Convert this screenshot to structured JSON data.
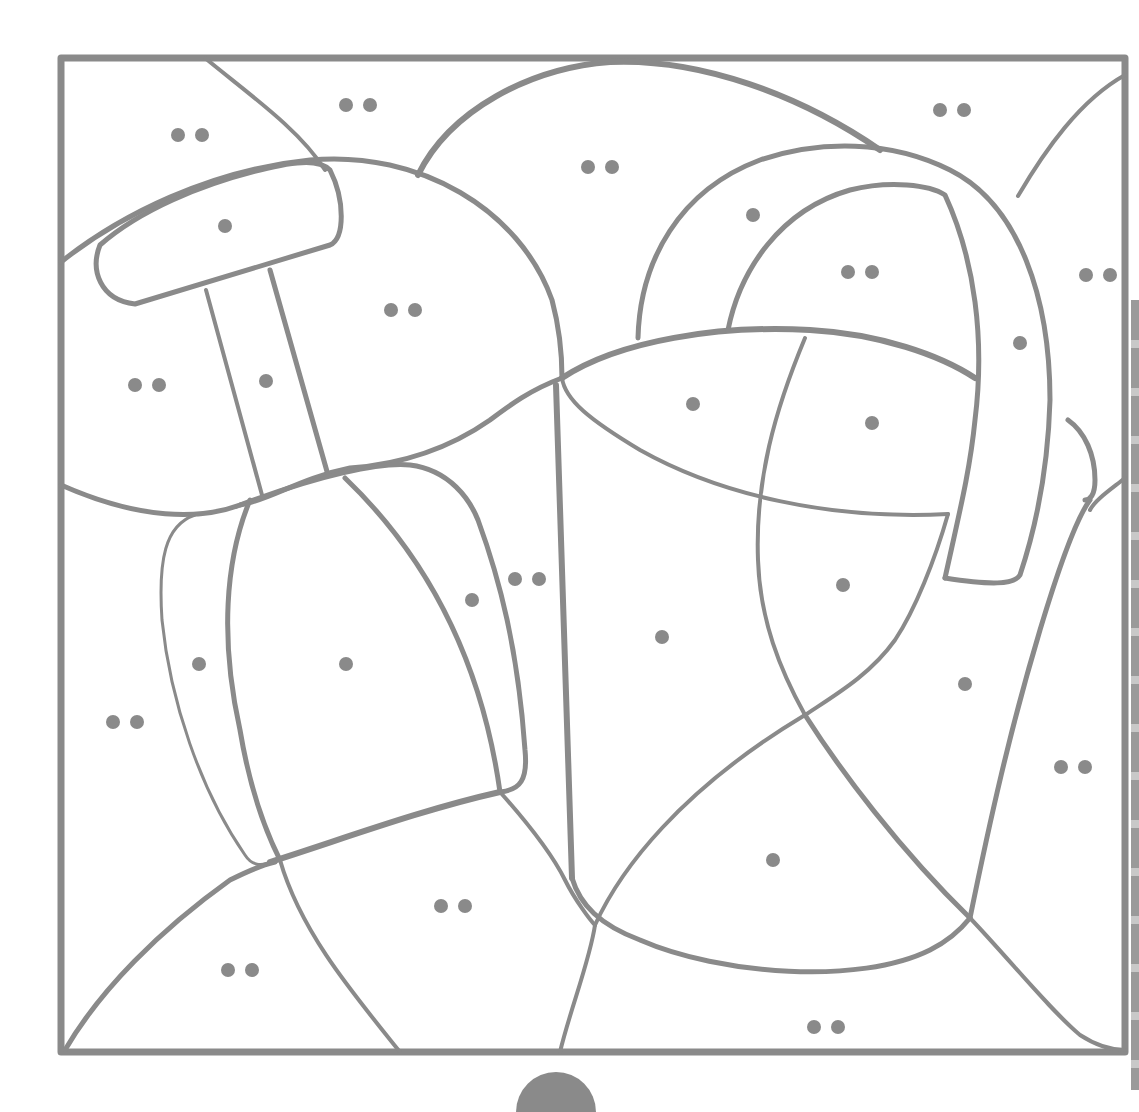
{
  "page": {
    "type": "color-by-code coloring page",
    "line_color": "#8a8a8a",
    "background": "#ffffff"
  },
  "frame": {
    "x": 58,
    "y": 55,
    "width": 1070,
    "height": 1000
  },
  "legend_codes": {
    "single_dot": "•",
    "double_dot": "••"
  },
  "markers": [
    {
      "x": 190,
      "y": 135,
      "code": "double"
    },
    {
      "x": 358,
      "y": 105,
      "code": "double"
    },
    {
      "x": 225,
      "y": 226,
      "code": "single"
    },
    {
      "x": 600,
      "y": 167,
      "code": "double"
    },
    {
      "x": 403,
      "y": 310,
      "code": "double"
    },
    {
      "x": 147,
      "y": 385,
      "code": "double"
    },
    {
      "x": 266,
      "y": 381,
      "code": "single"
    },
    {
      "x": 952,
      "y": 110,
      "code": "double"
    },
    {
      "x": 753,
      "y": 215,
      "code": "single"
    },
    {
      "x": 860,
      "y": 272,
      "code": "double"
    },
    {
      "x": 1098,
      "y": 275,
      "code": "double"
    },
    {
      "x": 1020,
      "y": 343,
      "code": "single"
    },
    {
      "x": 693,
      "y": 404,
      "code": "single"
    },
    {
      "x": 872,
      "y": 423,
      "code": "single"
    },
    {
      "x": 472,
      "y": 600,
      "code": "single"
    },
    {
      "x": 527,
      "y": 579,
      "code": "double"
    },
    {
      "x": 199,
      "y": 664,
      "code": "single"
    },
    {
      "x": 346,
      "y": 664,
      "code": "single"
    },
    {
      "x": 662,
      "y": 637,
      "code": "single"
    },
    {
      "x": 843,
      "y": 585,
      "code": "single"
    },
    {
      "x": 965,
      "y": 684,
      "code": "single"
    },
    {
      "x": 125,
      "y": 722,
      "code": "double"
    },
    {
      "x": 1073,
      "y": 767,
      "code": "double"
    },
    {
      "x": 773,
      "y": 860,
      "code": "single"
    },
    {
      "x": 453,
      "y": 906,
      "code": "double"
    },
    {
      "x": 240,
      "y": 970,
      "code": "double"
    },
    {
      "x": 826,
      "y": 1027,
      "code": "double"
    }
  ]
}
